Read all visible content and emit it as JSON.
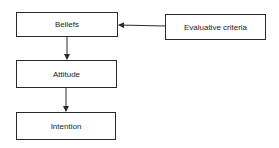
{
  "diagram": {
    "type": "flowchart",
    "nodes": [
      {
        "id": "beliefs",
        "label": "Beliefs"
      },
      {
        "id": "evaluative_criteria",
        "label": "Evaluative criteria"
      },
      {
        "id": "attitude",
        "label": "Attitude"
      },
      {
        "id": "intention",
        "label": "Intention"
      }
    ],
    "edges": [
      {
        "from": "evaluative_criteria",
        "to": "beliefs"
      },
      {
        "from": "beliefs",
        "to": "attitude"
      },
      {
        "from": "attitude",
        "to": "intention"
      }
    ],
    "colors": {
      "stroke": "#2a2a2a",
      "text": "#222222",
      "background": "#ffffff"
    }
  }
}
